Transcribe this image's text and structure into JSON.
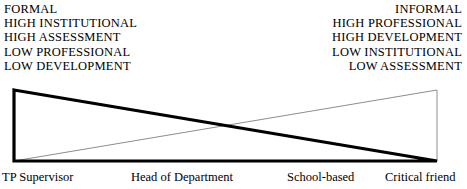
{
  "diagram": {
    "left_attributes": [
      "FORMAL",
      "HIGH INSTITUTIONAL",
      "HIGH ASSESSMENT",
      "LOW PROFESSIONAL",
      "LOW DEVELOPMENT"
    ],
    "right_attributes": [
      "INFORMAL",
      "HIGH PROFESSIONAL",
      "HIGH DEVELOPMENT",
      "LOW INSTITUTIONAL",
      "LOW ASSESSMENT"
    ],
    "role_labels": [
      "TP Supervisor",
      "Head of Department",
      "School-based",
      "Critical friend"
    ],
    "colors": {
      "ink": "#000000",
      "thin_line": "#8d8d8d",
      "background": "#ffffff"
    }
  }
}
